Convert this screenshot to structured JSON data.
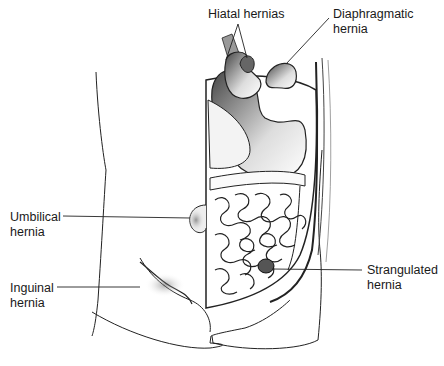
{
  "figure": {
    "labels": [
      {
        "id": "hiatal",
        "text": "Hiatal hernias",
        "x": 208,
        "y": 7
      },
      {
        "id": "diaphragmatic",
        "text": "Diaphragmatic\nhernia",
        "x": 333,
        "y": 7
      },
      {
        "id": "umbilical",
        "text": "Umbilical\nhernia",
        "x": 10,
        "y": 210
      },
      {
        "id": "inguinal",
        "text": "Inguinal\nhernia",
        "x": 10,
        "y": 281
      },
      {
        "id": "strangulated",
        "text": "Strangulated\nhernia",
        "x": 367,
        "y": 263
      }
    ]
  }
}
